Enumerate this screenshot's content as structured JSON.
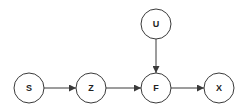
{
  "diagram": {
    "type": "directed-graph",
    "nodes": [
      {
        "id": "S",
        "label": "S",
        "x": 29,
        "y": 88
      },
      {
        "id": "Z",
        "label": "Z",
        "x": 91,
        "y": 88
      },
      {
        "id": "F",
        "label": "F",
        "x": 156,
        "y": 88
      },
      {
        "id": "U",
        "label": "U",
        "x": 156,
        "y": 24
      },
      {
        "id": "X",
        "label": "X",
        "x": 219,
        "y": 88
      }
    ],
    "edges": [
      {
        "from": "S",
        "to": "Z"
      },
      {
        "from": "Z",
        "to": "F"
      },
      {
        "from": "U",
        "to": "F"
      },
      {
        "from": "F",
        "to": "X"
      }
    ],
    "node_radius": 15,
    "colors": {
      "stroke": "#3a3a3a",
      "fill": "#ffffff",
      "text": "#222222"
    }
  }
}
